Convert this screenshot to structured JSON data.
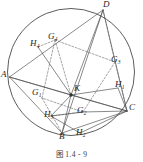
{
  "figure": {
    "caption": "图 1.4 - 9",
    "shape": "cyclic-quadrilateral-with-centroids-and-orthocenters",
    "stroke_color": "#4a4a4a",
    "label_color": "#1e1e1e"
  },
  "labels": {
    "A": {
      "text": "A",
      "sub": ""
    },
    "B": {
      "text": "B",
      "sub": ""
    },
    "C": {
      "text": "C",
      "sub": ""
    },
    "D": {
      "text": "D",
      "sub": ""
    },
    "K": {
      "text": "K",
      "sub": ""
    },
    "G1": {
      "text": "G",
      "sub": "1"
    },
    "G2": {
      "text": "G",
      "sub": "2"
    },
    "G3": {
      "text": "G",
      "sub": "3"
    },
    "G4": {
      "text": "G",
      "sub": "4"
    },
    "H1": {
      "text": "H",
      "sub": "1"
    },
    "H2": {
      "text": "H",
      "sub": "2"
    },
    "H3": {
      "text": "H",
      "sub": "3"
    },
    "H4": {
      "text": "H",
      "sub": "4"
    }
  },
  "geometry": {
    "circle": {
      "cx": 71,
      "cy": 72,
      "r": 63.5
    },
    "points": {
      "A": {
        "x": 9.5,
        "y": 77
      },
      "B": {
        "x": 62,
        "y": 133
      },
      "C": {
        "x": 127,
        "y": 111
      },
      "D": {
        "x": 103,
        "y": 10
      },
      "K": {
        "x": 71,
        "y": 95
      },
      "G1": {
        "x": 42,
        "y": 98
      },
      "G2": {
        "x": 83,
        "y": 112
      },
      "G3": {
        "x": 115,
        "y": 62
      },
      "G4": {
        "x": 55,
        "y": 40
      },
      "H1": {
        "x": 118,
        "y": 88
      },
      "H2": {
        "x": 80,
        "y": 133
      },
      "H3": {
        "x": 51,
        "y": 116
      },
      "H4": {
        "x": 38,
        "y": 47
      }
    }
  }
}
